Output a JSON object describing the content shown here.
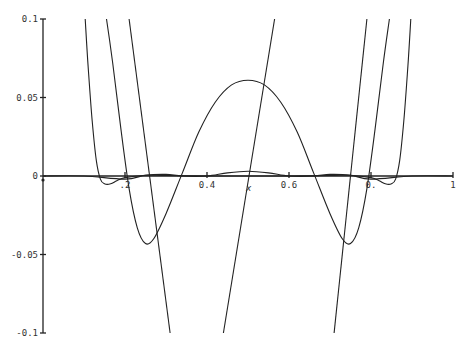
{
  "chart_data": {
    "type": "line",
    "title": "",
    "xlabel": "x",
    "ylabel": "",
    "xlim": [
      0,
      1
    ],
    "ylim": [
      -0.1,
      0.1
    ],
    "grid": false,
    "legend": null,
    "x_ticks": [
      {
        "value": 0.2,
        "label": ".2"
      },
      {
        "value": 0.4,
        "label": "0.4"
      },
      {
        "value": 0.6,
        "label": "0.6"
      },
      {
        "value": 0.8,
        "label": "0."
      },
      {
        "value": 1.0,
        "label": "1"
      }
    ],
    "y_ticks": [
      {
        "value": 0.1,
        "label": "0.1"
      },
      {
        "value": 0.05,
        "label": "0.05"
      },
      {
        "value": 0,
        "label": "0"
      },
      {
        "value": -0.05,
        "label": "-0.05"
      },
      {
        "value": -0.1,
        "label": "-0.1"
      }
    ],
    "series": [
      {
        "name": "large-oscillation",
        "description": "symmetric curve: peak ~0.061 at x=0.5, minima ~-0.043 near x=0.25 and x=0.75, exits top near x=0.16 and x=0.84",
        "points": [
          [
            0.155,
            0.1
          ],
          [
            0.17,
            0.072
          ],
          [
            0.19,
            0.03
          ],
          [
            0.21,
            -0.008
          ],
          [
            0.23,
            -0.033
          ],
          [
            0.25,
            -0.043
          ],
          [
            0.27,
            -0.04
          ],
          [
            0.3,
            -0.024
          ],
          [
            0.34,
            0.002
          ],
          [
            0.38,
            0.028
          ],
          [
            0.42,
            0.047
          ],
          [
            0.46,
            0.058
          ],
          [
            0.5,
            0.061
          ],
          [
            0.54,
            0.058
          ],
          [
            0.58,
            0.047
          ],
          [
            0.62,
            0.028
          ],
          [
            0.66,
            0.002
          ],
          [
            0.7,
            -0.024
          ],
          [
            0.73,
            -0.04
          ],
          [
            0.75,
            -0.043
          ],
          [
            0.77,
            -0.033
          ],
          [
            0.79,
            -0.008
          ],
          [
            0.81,
            0.03
          ],
          [
            0.83,
            0.072
          ],
          [
            0.845,
            0.1
          ]
        ]
      },
      {
        "name": "w-shaped",
        "description": "minima ~-0.005 near x=0.15 and x=0.85, nearly zero between, exits top near x=0.1 and x=0.9",
        "points": [
          [
            0.103,
            0.1
          ],
          [
            0.11,
            0.07
          ],
          [
            0.12,
            0.035
          ],
          [
            0.13,
            0.01
          ],
          [
            0.14,
            -0.002
          ],
          [
            0.15,
            -0.005
          ],
          [
            0.165,
            -0.005
          ],
          [
            0.18,
            -0.003
          ],
          [
            0.2,
            -0.001
          ],
          [
            0.25,
            0.0005
          ],
          [
            0.3,
            0.0003
          ],
          [
            0.4,
            0.0
          ],
          [
            0.5,
            0.0
          ],
          [
            0.6,
            0.0
          ],
          [
            0.7,
            0.0003
          ],
          [
            0.75,
            0.0005
          ],
          [
            0.8,
            -0.001
          ],
          [
            0.82,
            -0.003
          ],
          [
            0.835,
            -0.005
          ],
          [
            0.85,
            -0.005
          ],
          [
            0.86,
            -0.002
          ],
          [
            0.87,
            0.01
          ],
          [
            0.88,
            0.035
          ],
          [
            0.89,
            0.07
          ],
          [
            0.897,
            0.1
          ]
        ]
      },
      {
        "name": "small-oscillation",
        "description": "low amplitude wave near zero, peak ~0.003 at x=0.5",
        "points": [
          [
            0.0,
            0.0
          ],
          [
            0.1,
            0.0
          ],
          [
            0.2,
            -0.002
          ],
          [
            0.25,
            0.0005
          ],
          [
            0.3,
            0.001
          ],
          [
            0.34,
            0.0
          ],
          [
            0.4,
            0.0
          ],
          [
            0.45,
            0.002
          ],
          [
            0.5,
            0.003
          ],
          [
            0.55,
            0.002
          ],
          [
            0.6,
            0.0
          ],
          [
            0.66,
            0.0
          ],
          [
            0.7,
            0.001
          ],
          [
            0.75,
            0.0005
          ],
          [
            0.8,
            -0.002
          ],
          [
            0.9,
            0.0
          ],
          [
            1.0,
            0.0
          ]
        ]
      },
      {
        "name": "steep-line-decreasing",
        "description": "steep line from top near x=0.21 to bottom near x=0.31",
        "points": [
          [
            0.21,
            0.1
          ],
          [
            0.31,
            -0.1
          ]
        ]
      },
      {
        "name": "steep-line-increasing-middle",
        "description": "steep line from bottom near x=0.44 to top near x=0.565",
        "points": [
          [
            0.44,
            -0.1
          ],
          [
            0.565,
            0.1
          ]
        ]
      },
      {
        "name": "steep-line-increasing-right",
        "description": "steep line from bottom near x=0.71 to top near x=0.79",
        "points": [
          [
            0.71,
            -0.1
          ],
          [
            0.79,
            0.1
          ]
        ]
      }
    ]
  },
  "plot_area": {
    "left": 43,
    "right": 453,
    "top": 19,
    "bottom": 333
  }
}
